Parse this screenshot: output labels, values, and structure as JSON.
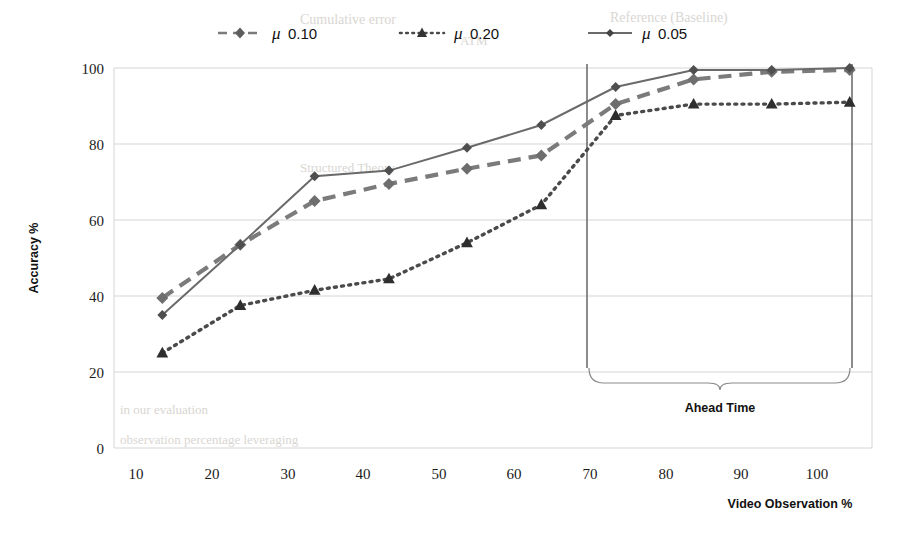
{
  "chart_data": {
    "type": "line",
    "title": "",
    "xlabel": "Video Observation %",
    "ylabel": "Accuracy %",
    "xlim": [
      5,
      107
    ],
    "ylim": [
      0,
      100
    ],
    "xticks": [
      10,
      20,
      30,
      40,
      50,
      60,
      70,
      80,
      90,
      100
    ],
    "yticks": [
      0,
      20,
      40,
      60,
      80,
      100
    ],
    "grid": true,
    "legend_position": "top",
    "x": [
      11.5,
      22,
      32,
      42,
      52.5,
      62.5,
      72.5,
      83,
      93.5,
      104
    ],
    "series": [
      {
        "name": "μ 0.10",
        "mu": "0.10",
        "style": "dashed",
        "marker": "diamond",
        "color": "#7b7b7b",
        "values": [
          39.5,
          53.5,
          65,
          69.5,
          73.5,
          77,
          90.5,
          97,
          99,
          99.5
        ]
      },
      {
        "name": "μ 0.20",
        "mu": "0.20",
        "style": "dotted",
        "marker": "triangle",
        "color": "#4a4a4a",
        "values": [
          25,
          37.5,
          41.5,
          44.5,
          54,
          64,
          87.5,
          90.5,
          90.5,
          91
        ]
      },
      {
        "name": "μ 0.05",
        "mu": "0.05",
        "style": "solid",
        "marker": "diamond",
        "color": "#6a6a6a",
        "values": [
          35,
          53.5,
          71.5,
          73,
          79,
          85,
          95,
          99.5,
          99.5,
          100
        ]
      }
    ],
    "annotations": [
      {
        "label": "Ahead Time",
        "type": "brace",
        "x_start": 70,
        "x_end": 105
      }
    ]
  },
  "legend": {
    "items": [
      {
        "mu_symbol": "μ",
        "value": "0.10"
      },
      {
        "mu_symbol": "μ",
        "value": "0.20"
      },
      {
        "mu_symbol": "μ",
        "value": "0.05"
      }
    ]
  },
  "axes": {
    "y_title": "Accuracy %",
    "x_title": "Video Observation %",
    "y_ticks": [
      "100",
      "80",
      "60",
      "40",
      "20",
      "0"
    ],
    "x_ticks": [
      "10",
      "20",
      "30",
      "40",
      "50",
      "60",
      "70",
      "80",
      "90",
      "100"
    ]
  },
  "annotation": {
    "ahead_time_label": "Ahead Time"
  },
  "background_bleed": {
    "line1": "Cumulative error",
    "line2": "Reference (Baseline)",
    "line3": "ATM",
    "line4": "Ahead Time",
    "line5": "0.05",
    "line6": "Structured Theory",
    "line7": "in our evaluation",
    "line8": "observation percentage leveraging"
  },
  "colors": {
    "grid": "#d5d5d5",
    "axis_text": "#1b1b1b",
    "mu_010": "#7b7b7b",
    "mu_020": "#4a4a4a",
    "mu_005": "#6a6a6a",
    "vline": "#6f6f6f"
  }
}
